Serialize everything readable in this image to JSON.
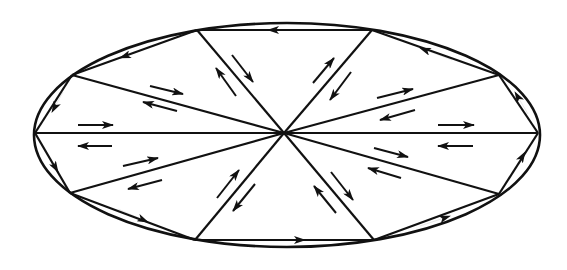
{
  "diagram": {
    "colors": {
      "line": "#111111",
      "background": "#ffffff"
    },
    "ellipse": {
      "cx": 287,
      "cy": 135,
      "rx": 253,
      "ry": 112
    },
    "center": {
      "x": 284,
      "y": 133
    },
    "vertices": [
      {
        "id": "left",
        "x": 35,
        "y": 133
      },
      {
        "id": "upper-left",
        "x": 72,
        "y": 75
      },
      {
        "id": "top-left",
        "x": 197,
        "y": 30
      },
      {
        "id": "top-right",
        "x": 372,
        "y": 30
      },
      {
        "id": "upper-right",
        "x": 499,
        "y": 75
      },
      {
        "id": "right",
        "x": 538,
        "y": 133
      },
      {
        "id": "lower-right",
        "x": 499,
        "y": 194
      },
      {
        "id": "bottom-right",
        "x": 374,
        "y": 240
      },
      {
        "id": "bottom-left",
        "x": 195,
        "y": 240
      },
      {
        "id": "lower-left",
        "x": 70,
        "y": 193
      }
    ],
    "edge_arrows": [
      {
        "edge": "top",
        "x1": 300,
        "y1": 30,
        "x2": 268,
        "y2": 30
      },
      {
        "edge": "top-left",
        "x1": 150,
        "y1": 47,
        "x2": 120,
        "y2": 58
      },
      {
        "edge": "upper-left",
        "x1": 63,
        "y1": 92,
        "x2": 52,
        "y2": 112
      },
      {
        "edge": "lower-left",
        "x1": 45,
        "y1": 150,
        "x2": 58,
        "y2": 172
      },
      {
        "edge": "bottom-left-edge",
        "x1": 118,
        "y1": 209,
        "x2": 148,
        "y2": 222
      },
      {
        "edge": "bottom",
        "x1": 272,
        "y1": 240,
        "x2": 305,
        "y2": 240
      },
      {
        "edge": "bottom-right-edge",
        "x1": 420,
        "y1": 226,
        "x2": 450,
        "y2": 216
      },
      {
        "edge": "lower-right",
        "x1": 512,
        "y1": 174,
        "x2": 525,
        "y2": 152
      },
      {
        "edge": "upper-right",
        "x1": 528,
        "y1": 114,
        "x2": 515,
        "y2": 92
      },
      {
        "edge": "top-right",
        "x1": 452,
        "y1": 60,
        "x2": 420,
        "y2": 48
      }
    ],
    "spoke_arrows": [
      {
        "spoke": "upper-left",
        "out": [
          150,
          86,
          183,
          94
        ],
        "in": [
          177,
          111,
          143,
          102
        ]
      },
      {
        "spoke": "top-left",
        "out": [
          232,
          55,
          253,
          82
        ],
        "in": [
          236,
          96,
          216,
          68
        ]
      },
      {
        "spoke": "top-right",
        "out": [
          313,
          83,
          334,
          58
        ],
        "in": [
          351,
          72,
          330,
          100
        ]
      },
      {
        "spoke": "upper-right",
        "out": [
          377,
          98,
          413,
          89
        ],
        "in": [
          415,
          110,
          380,
          120
        ]
      },
      {
        "spoke": "left",
        "out": [
          78,
          125,
          113,
          125
        ],
        "in": [
          112,
          146,
          78,
          146
        ]
      },
      {
        "spoke": "right",
        "out": [
          438,
          125,
          474,
          125
        ],
        "in": [
          473,
          146,
          438,
          146
        ]
      },
      {
        "spoke": "lower-left",
        "out": [
          123,
          166,
          158,
          158
        ],
        "in": [
          162,
          180,
          128,
          189
        ]
      },
      {
        "spoke": "bottom-left",
        "out": [
          217,
          198,
          239,
          170
        ],
        "in": [
          255,
          184,
          233,
          211
        ]
      },
      {
        "spoke": "bottom-right",
        "out": [
          331,
          172,
          353,
          200
        ],
        "in": [
          336,
          213,
          314,
          186
        ]
      },
      {
        "spoke": "lower-right",
        "out": [
          374,
          148,
          408,
          157
        ],
        "in": [
          401,
          178,
          368,
          168
        ]
      }
    ]
  }
}
